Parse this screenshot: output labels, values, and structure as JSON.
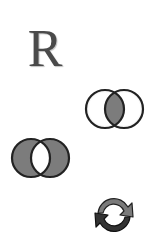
{
  "icons": [
    {
      "name": "r-letter-icon",
      "glyph": "R"
    },
    {
      "name": "venn-intersection-icon",
      "label": "intersection"
    },
    {
      "name": "venn-symmetric-difference-icon",
      "label": "symmetric difference"
    },
    {
      "name": "refresh-icon",
      "label": "refresh"
    }
  ],
  "colors": {
    "background": "#ffffff",
    "outline": "#222222",
    "fill": "#7c7c7c",
    "arrow_light": "#7a7a7a",
    "arrow_dark": "#333333"
  }
}
